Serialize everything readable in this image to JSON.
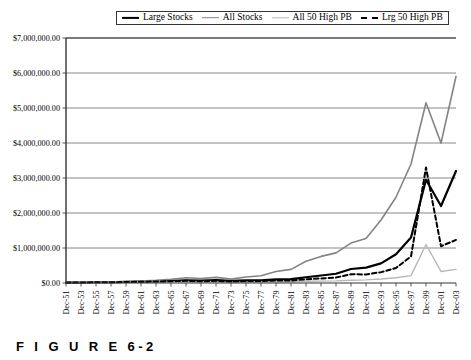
{
  "caption": "F I G U R E  6-2",
  "legend": {
    "position": "top-center",
    "items": [
      {
        "label": "Large Stocks",
        "key": "large_stocks",
        "style": "solid",
        "color": "#000000",
        "width": 2.2
      },
      {
        "label": "All Stocks",
        "key": "all_stocks",
        "style": "solid",
        "color": "#848484",
        "width": 1.6
      },
      {
        "label": "All 50 High PB",
        "key": "all_50_high_pb",
        "style": "solid",
        "color": "#b8b8b8",
        "width": 1.4
      },
      {
        "label": "Lrg 50 High PB",
        "key": "lrg_50_high_pb",
        "style": "dashed",
        "color": "#000000",
        "width": 2.0
      }
    ]
  },
  "chart_data": {
    "type": "line",
    "title": "",
    "xlabel": "",
    "ylabel": "",
    "grid": true,
    "ylim": [
      0,
      7000000
    ],
    "ytick_labels": [
      "$0.00",
      "$1,000,000.00",
      "$2,000,000.00",
      "$3,000,000.00",
      "$4,000,000.00",
      "$5,000,000.00",
      "$6,000,000.00",
      "$7,000,000.00"
    ],
    "ytick_values": [
      0,
      1000000,
      2000000,
      3000000,
      4000000,
      5000000,
      6000000,
      7000000
    ],
    "categories": [
      "Dec-51",
      "Dec-53",
      "Dec-55",
      "Dec-57",
      "Dec-59",
      "Dec-61",
      "Dec-63",
      "Dec-65",
      "Dec-67",
      "Dec-69",
      "Dec-71",
      "Dec-73",
      "Dec-75",
      "Dec-77",
      "Dec-79",
      "Dec-81",
      "Dec-83",
      "Dec-85",
      "Dec-87",
      "Dec-89",
      "Dec-91",
      "Dec-93",
      "Dec-95",
      "Dec-97",
      "Dec-99",
      "Dec-01",
      "Dec-03"
    ],
    "series": [
      {
        "name": "Large Stocks",
        "color": "#000000",
        "style": "solid",
        "width": 2.2,
        "values": [
          10000,
          14000,
          24000,
          22000,
          34000,
          41000,
          50000,
          62000,
          74000,
          66000,
          82000,
          62000,
          78000,
          76000,
          104000,
          110000,
          165000,
          215000,
          265000,
          400000,
          440000,
          560000,
          820000,
          1300000,
          2950000,
          2200000,
          3200000
        ]
      },
      {
        "name": "All Stocks",
        "color": "#848484",
        "style": "solid",
        "width": 1.6,
        "values": [
          10000,
          16000,
          30000,
          27000,
          45000,
          58000,
          76000,
          104000,
          150000,
          128000,
          160000,
          110000,
          170000,
          205000,
          330000,
          390000,
          620000,
          760000,
          860000,
          1140000,
          1270000,
          1800000,
          2450000,
          3400000,
          5150000,
          4000000,
          5900000
        ]
      },
      {
        "name": "All 50 High PB",
        "color": "#b8b8b8",
        "style": "solid",
        "width": 1.4,
        "values": [
          10000,
          13000,
          20000,
          16000,
          24000,
          27000,
          31000,
          36000,
          44000,
          36000,
          42000,
          26000,
          33000,
          30000,
          38000,
          36000,
          48000,
          54000,
          60000,
          78000,
          90000,
          115000,
          150000,
          210000,
          1100000,
          330000,
          390000
        ]
      },
      {
        "name": "Lrg 50 High PB",
        "color": "#000000",
        "style": "dashed",
        "width": 2.0,
        "values": [
          10000,
          14000,
          22000,
          19000,
          30000,
          35000,
          42000,
          52000,
          62000,
          50000,
          62000,
          44000,
          56000,
          54000,
          72000,
          70000,
          105000,
          130000,
          155000,
          250000,
          245000,
          310000,
          430000,
          760000,
          3300000,
          1050000,
          1230000
        ]
      }
    ]
  }
}
